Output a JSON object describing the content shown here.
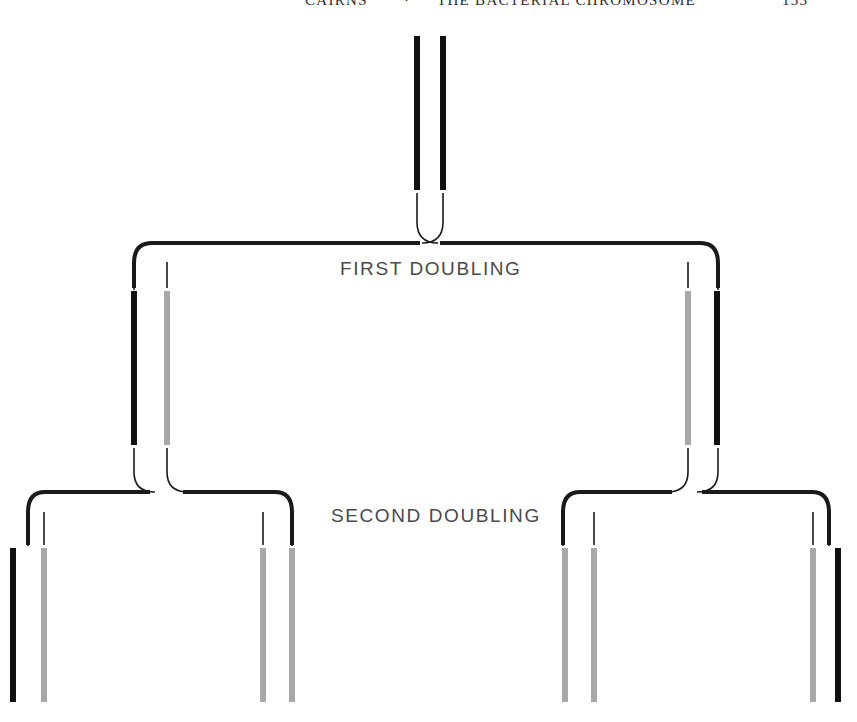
{
  "page": {
    "width": 857,
    "height": 722,
    "background": "#ffffff"
  },
  "running_head": {
    "author": "CAIRNS",
    "separator": "·",
    "title": "THE BACTERIAL CHROMOSOME",
    "page_number": "133",
    "clipped": "true"
  },
  "labels": {
    "first_doubling": "FIRST DOUBLING",
    "second_doubling": "SECOND DOUBLING"
  },
  "colors": {
    "parental_strand": "#111111",
    "new_strand": "#a8a8a8",
    "connector": "#1a1a1a",
    "background": "#ffffff",
    "label_text": "#4a4a4a",
    "header_text": "#2e2e2e"
  },
  "diagram": {
    "type": "semiconservative-replication-tree",
    "generations": [
      {
        "name": "parent",
        "level": 0,
        "bar_top": 36,
        "bar_bottom": 190,
        "duplexes": [
          {
            "center_x": 430,
            "strands": [
              {
                "x": 414,
                "color_role": "parental_strand"
              },
              {
                "x": 440,
                "color_role": "parental_strand"
              }
            ]
          }
        ]
      },
      {
        "name": "first-doubling",
        "level": 1,
        "bar_top": 291,
        "bar_bottom": 445,
        "connector_y": 243,
        "duplexes": [
          {
            "center_x": 150,
            "strands": [
              {
                "x": 131,
                "color_role": "parental_strand"
              },
              {
                "x": 164,
                "color_role": "new_strand"
              }
            ]
          },
          {
            "center_x": 702,
            "strands": [
              {
                "x": 685,
                "color_role": "new_strand"
              },
              {
                "x": 714,
                "color_role": "parental_strand"
              }
            ]
          }
        ]
      },
      {
        "name": "second-doubling",
        "level": 2,
        "bar_top": 548,
        "bar_bottom": 702,
        "connector_y": 492,
        "duplexes": [
          {
            "center_x": 28,
            "strands": [
              {
                "x": 10,
                "color_role": "parental_strand"
              },
              {
                "x": 41,
                "color_role": "new_strand"
              }
            ]
          },
          {
            "center_x": 277,
            "strands": [
              {
                "x": 260,
                "color_role": "new_strand"
              },
              {
                "x": 289,
                "color_role": "new_strand"
              }
            ]
          },
          {
            "center_x": 579,
            "strands": [
              {
                "x": 562,
                "color_role": "new_strand"
              },
              {
                "x": 591,
                "color_role": "new_strand"
              }
            ]
          },
          {
            "center_x": 828,
            "strands": [
              {
                "x": 810,
                "color_role": "new_strand"
              },
              {
                "x": 835,
                "color_role": "parental_strand"
              }
            ]
          }
        ]
      }
    ],
    "bar_width": 6,
    "thin_line_width": 1.6,
    "connector_width": 4
  }
}
